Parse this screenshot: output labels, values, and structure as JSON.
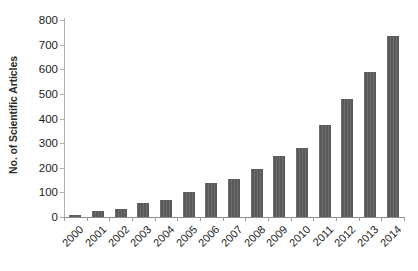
{
  "chart_data": {
    "type": "bar",
    "title": "",
    "subtitle": "",
    "xlabel": "",
    "ylabel": "No. of Scientific Articles",
    "categories": [
      "2000",
      "2001",
      "2002",
      "2003",
      "2004",
      "2005",
      "2006",
      "2007",
      "2008",
      "2009",
      "2010",
      "2011",
      "2012",
      "2013",
      "2014"
    ],
    "values": [
      8,
      25,
      32,
      55,
      70,
      100,
      140,
      155,
      195,
      248,
      282,
      372,
      480,
      590,
      735
    ],
    "series": [
      {
        "name": "No. of Scientific Articles",
        "values": [
          8,
          25,
          32,
          55,
          70,
          100,
          140,
          155,
          195,
          248,
          282,
          372,
          480,
          590,
          735
        ]
      }
    ],
    "ylim": [
      0,
      800
    ],
    "y_ticks": [
      0,
      100,
      200,
      300,
      400,
      500,
      600,
      700,
      800
    ],
    "y_tick_labels": [
      "0",
      "100",
      "200",
      "300",
      "400",
      "500",
      "600",
      "700",
      "800"
    ],
    "grid": false,
    "legend": false,
    "legend_position": "none",
    "bar_color": "#5a5a5a",
    "axis_color": "#9a9a9a",
    "text_color": "#1c1c1c",
    "background_color": "#ffffff",
    "x_tick_rotation": -45
  }
}
